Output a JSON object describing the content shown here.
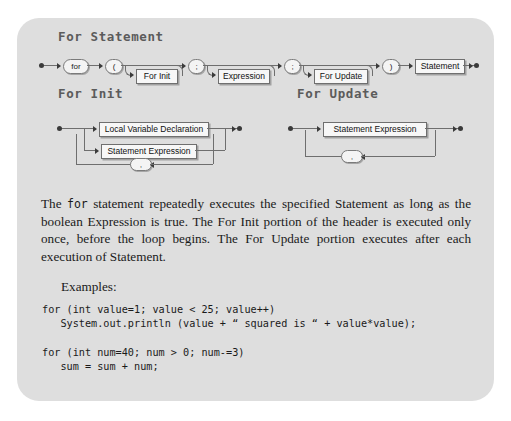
{
  "page": {
    "background_color": "#ffffff",
    "panel_color": "#dedede"
  },
  "headings": {
    "for_statement": "For Statement",
    "for_init": "For Init",
    "for_update": "For Update"
  },
  "diagrams": [
    {
      "name": "for-statement",
      "title": "For Statement",
      "nodes": [
        {
          "kind": "terminal",
          "label": "for"
        },
        {
          "kind": "terminal",
          "label": "("
        },
        {
          "kind": "nonterminal",
          "label": "For Init"
        },
        {
          "kind": "terminal",
          "label": ";"
        },
        {
          "kind": "nonterminal",
          "label": "Expression"
        },
        {
          "kind": "terminal",
          "label": ";"
        },
        {
          "kind": "nonterminal",
          "label": "For Update"
        },
        {
          "kind": "terminal",
          "label": ")"
        },
        {
          "kind": "nonterminal",
          "label": "Statement"
        }
      ]
    },
    {
      "name": "for-init",
      "title": "For Init",
      "nodes": [
        {
          "kind": "nonterminal",
          "label": "Local Variable Declaration"
        },
        {
          "kind": "nonterminal",
          "label": "Statement Expression"
        },
        {
          "kind": "terminal",
          "label": ","
        }
      ]
    },
    {
      "name": "for-update",
      "title": "For Update",
      "nodes": [
        {
          "kind": "nonterminal",
          "label": "Statement Expression"
        },
        {
          "kind": "terminal",
          "label": ","
        }
      ]
    }
  ],
  "body": {
    "paragraph_lead": "The ",
    "paragraph_code": "for",
    "paragraph_rest": " statement repeatedly executes the specified Statement as long as the boolean Expression is true. The For Init portion of the header is executed only once, before the loop begins. The For Update portion executes after each execution of Statement.",
    "examples_label": "Examples:",
    "code_example_1": "for (int value=1; value < 25; value++)\n   System.out.println (value + “ squared is “ + value*value);",
    "code_example_2": "for (int num=40; num > 0; num-=3)\n   sum = sum + num;"
  }
}
